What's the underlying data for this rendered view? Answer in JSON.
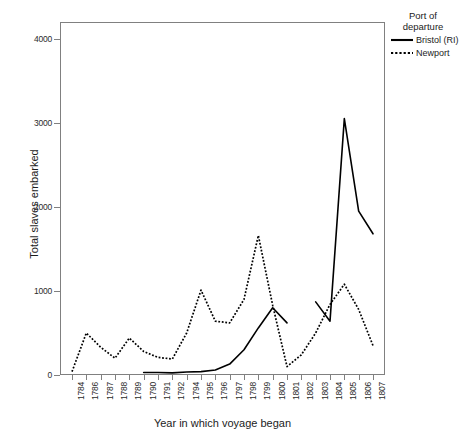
{
  "chart_data": {
    "type": "line",
    "title": "",
    "xlabel": "Year in which voyage began",
    "ylabel": "Total slaves embarked",
    "ylim": [
      0,
      4200
    ],
    "yticks": [
      0,
      1000,
      2000,
      3000,
      4000
    ],
    "ytick_labels": [
      "0",
      "1000",
      "2000",
      "3000",
      "4000"
    ],
    "grid": false,
    "legend_position": "right",
    "legend_title": "Port of departure",
    "categories": [
      "1784",
      "1786",
      "1787",
      "1788",
      "1789",
      "1790",
      "1791",
      "1792",
      "1794",
      "1795",
      "1796",
      "1797",
      "1798",
      "1799",
      "1800",
      "1801",
      "1802",
      "1803",
      "1804",
      "1805",
      "1806",
      "1807"
    ],
    "series": [
      {
        "name": "Bristol (RI)",
        "style": "solid",
        "color": "#000000",
        "values": [
          null,
          null,
          null,
          null,
          null,
          30,
          30,
          25,
          35,
          40,
          60,
          130,
          300,
          560,
          800,
          620,
          null,
          870,
          640,
          3050,
          1950,
          1680
        ]
      },
      {
        "name": "Newport",
        "style": "dotted",
        "color": "#000000",
        "values": [
          40,
          500,
          330,
          200,
          440,
          280,
          210,
          190,
          500,
          1010,
          640,
          620,
          900,
          1660,
          830,
          100,
          240,
          500,
          840,
          1080,
          780,
          350
        ]
      }
    ]
  },
  "axes": {
    "y_title": "Total slaves embarked",
    "x_title": "Year in which voyage began"
  },
  "legend": {
    "title_line_1": "Port of",
    "title_line_2": "departure",
    "entries": [
      {
        "label": "Bristol (RI)",
        "key": "solid-line-key"
      },
      {
        "label": "Newport",
        "key": "dotted-line-key"
      }
    ]
  }
}
